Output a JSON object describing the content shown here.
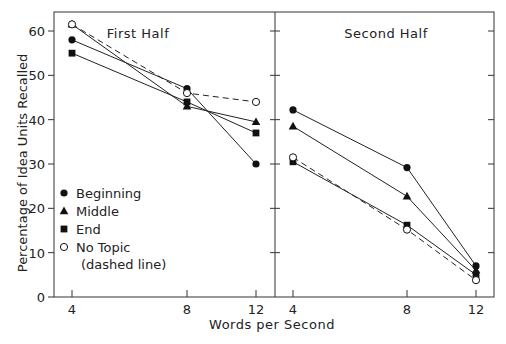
{
  "chart_data": {
    "type": "line",
    "ylabel": "Percentage of Idea Units Recalled",
    "xlabel": "Words per Second",
    "ylim": [
      0,
      60
    ],
    "yticks": [
      0,
      10,
      20,
      30,
      40,
      50,
      60
    ],
    "x": [
      4,
      8,
      12
    ],
    "xtick_labels": [
      "4",
      "8",
      "12"
    ],
    "grid": false,
    "legend": {
      "position": "lower-left of first panel",
      "entries": [
        {
          "label": "Beginning",
          "marker": "filled-circle"
        },
        {
          "label": "Middle",
          "marker": "filled-triangle"
        },
        {
          "label": "End",
          "marker": "filled-square"
        },
        {
          "label": "No Topic",
          "marker": "open-circle",
          "note": "(dashed line)"
        }
      ]
    },
    "panels": [
      {
        "title": "First Half",
        "series": [
          {
            "name": "Beginning",
            "marker": "filled-circle",
            "dashed": false,
            "values": [
              58,
              47,
              30
            ]
          },
          {
            "name": "Middle",
            "marker": "filled-triangle",
            "dashed": false,
            "values": [
              61.5,
              43,
              39.5
            ]
          },
          {
            "name": "End",
            "marker": "filled-square",
            "dashed": false,
            "values": [
              55,
              44,
              37
            ]
          },
          {
            "name": "No Topic",
            "marker": "open-circle",
            "dashed": true,
            "values": [
              61.5,
              46,
              44
            ]
          }
        ]
      },
      {
        "title": "Second Half",
        "series": [
          {
            "name": "Beginning",
            "marker": "filled-circle",
            "dashed": false,
            "values": [
              42.2,
              29.2,
              7
            ]
          },
          {
            "name": "Middle",
            "marker": "filled-triangle",
            "dashed": false,
            "values": [
              38.5,
              22.7,
              6
            ]
          },
          {
            "name": "End",
            "marker": "filled-square",
            "dashed": false,
            "values": [
              30.5,
              16.2,
              5
            ]
          },
          {
            "name": "No Topic",
            "marker": "open-circle",
            "dashed": true,
            "values": [
              31.5,
              15.2,
              3.8
            ]
          }
        ]
      }
    ]
  },
  "layout_text": {
    "ylabel": "Percentage of Idea Units Recalled",
    "xlabel": "Words per Second",
    "legend_note": "(dashed line)"
  }
}
